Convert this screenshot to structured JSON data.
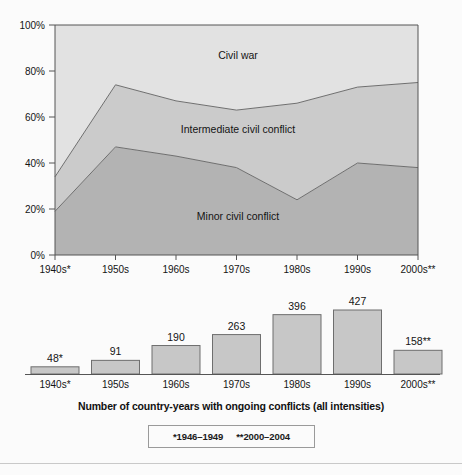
{
  "figure": {
    "background_color": "#fbfbfb",
    "caption": "Number of country-years with ongoing conflicts (all intensities)",
    "footnotes": {
      "first": "*1946–1949",
      "second": "**2000–2004"
    }
  },
  "chart_data": [
    {
      "type": "area",
      "stacked": true,
      "normalized": true,
      "title": "",
      "subtitle": "",
      "xlabel": "",
      "ylabel": "",
      "categories": [
        "1940s*",
        "1950s",
        "1960s",
        "1970s",
        "1980s",
        "1990s",
        "2000s**"
      ],
      "ytick_labels": [
        "0%",
        "20%",
        "40%",
        "60%",
        "80%",
        "100%"
      ],
      "ytick_values": [
        0,
        20,
        40,
        60,
        80,
        100
      ],
      "ylim": [
        0,
        100
      ],
      "grid": false,
      "legend": "inline-area-labels",
      "series": [
        {
          "name": "Minor civil conflict",
          "color": "#b3b3b3",
          "label_position": "inside-bottom",
          "values": [
            19,
            47,
            43,
            38,
            24,
            40,
            38
          ]
        },
        {
          "name": "Intermediate civil conflict",
          "color": "#cbcbcb",
          "label_position": "inside-middle",
          "values": [
            15,
            27,
            24,
            25,
            42,
            33,
            37
          ]
        },
        {
          "name": "Civil war",
          "color": "#e2e2e2",
          "label_position": "inside-top",
          "values": [
            66,
            26,
            33,
            37,
            34,
            27,
            25
          ]
        }
      ],
      "cumulative_upper_boundaries": {
        "minor_civil_conflict": [
          19,
          47,
          43,
          38,
          24,
          40,
          38
        ],
        "intermediate_civil_conflict": [
          34,
          74,
          67,
          63,
          66,
          73,
          75
        ]
      }
    },
    {
      "type": "bar",
      "title": "",
      "xlabel": "",
      "ylabel": "",
      "categories": [
        "1940s*",
        "1950s",
        "1960s",
        "1970s",
        "1980s",
        "1990s",
        "2000s**"
      ],
      "values": [
        48,
        91,
        190,
        263,
        396,
        427,
        158
      ],
      "data_labels": [
        "48*",
        "91",
        "190",
        "263",
        "396",
        "427",
        "158**"
      ],
      "bar_color": "#c7c7c7",
      "bar_border_color": "#6e6e6e",
      "ylim": [
        0,
        470
      ],
      "grid": false,
      "axis_line": true
    }
  ]
}
